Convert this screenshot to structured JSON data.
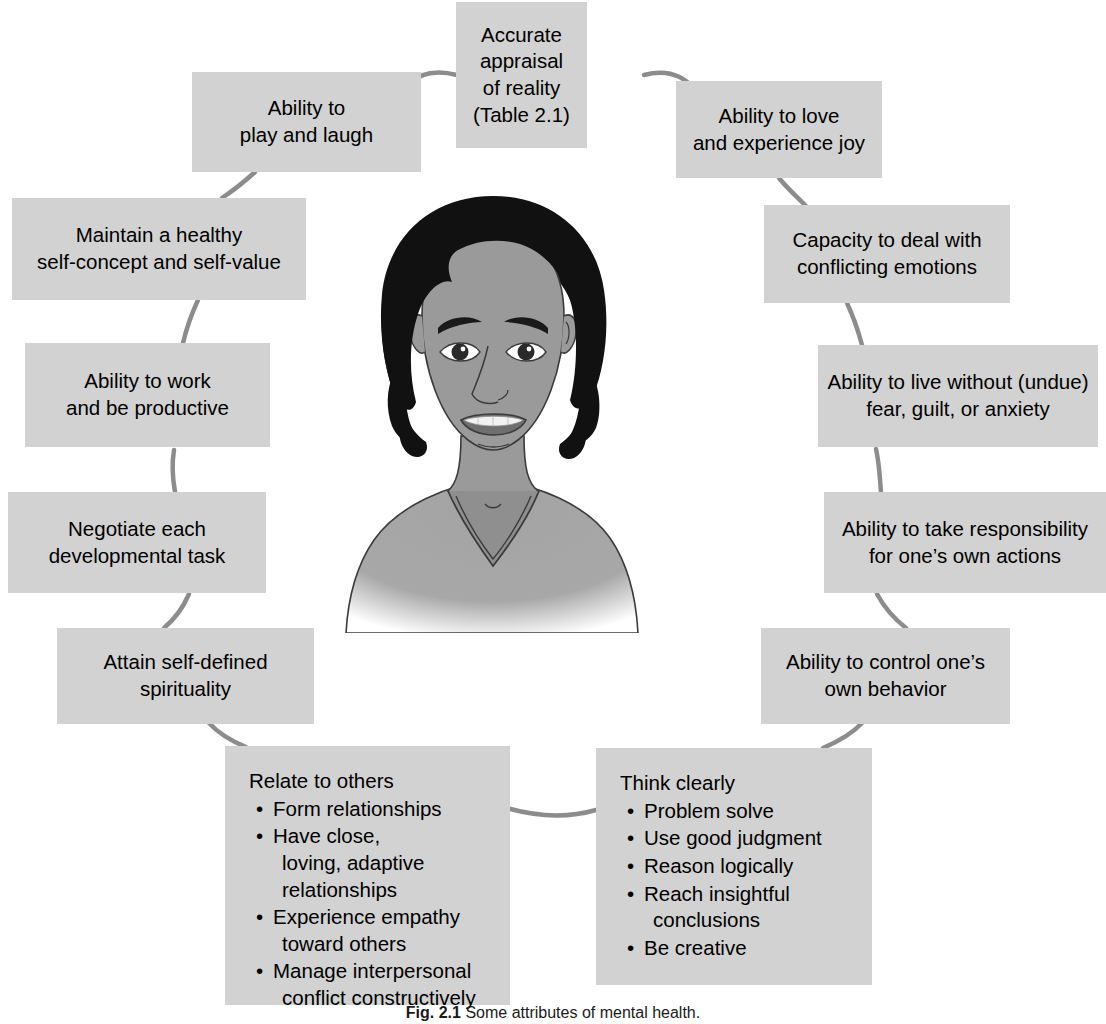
{
  "figure": {
    "caption_label": "Fig. 2.1",
    "caption_text": "Some attributes of mental health.",
    "background_color": "#ffffff",
    "box_color": "#d2d2d2",
    "connector_color": "#8c8c8c",
    "text_color": "#000000"
  },
  "center_image": {
    "alt": "Grayscale illustration of a smiling person with short curly dark hair wearing a v-neck shirt",
    "hair_color": "#111111",
    "skin_color": "#9a9a9a",
    "shirt_color": "#a8a8a8"
  },
  "nodes": [
    {
      "id": "accurate-appraisal",
      "lines": [
        "Accurate",
        "appraisal",
        "of reality",
        "(Table 2.1)"
      ]
    },
    {
      "id": "play-and-laugh",
      "lines": [
        "Ability to",
        "play and laugh"
      ]
    },
    {
      "id": "love-and-joy",
      "lines": [
        "Ability to love",
        "and experience joy"
      ]
    },
    {
      "id": "healthy-self-concept",
      "lines": [
        "Maintain a healthy",
        "self-concept and self-value"
      ]
    },
    {
      "id": "conflicting-emotions",
      "lines": [
        "Capacity to deal with",
        "conflicting emotions"
      ]
    },
    {
      "id": "work-and-productive",
      "lines": [
        "Ability to work",
        "and be productive"
      ]
    },
    {
      "id": "live-without-fear",
      "lines": [
        "Ability to live without (undue)",
        "fear, guilt, or anxiety"
      ]
    },
    {
      "id": "developmental-task",
      "lines": [
        "Negotiate each",
        "developmental task"
      ]
    },
    {
      "id": "take-responsibility",
      "lines": [
        "Ability to take responsibility",
        "for one’s own actions"
      ]
    },
    {
      "id": "self-defined-spirituality",
      "lines": [
        "Attain self-defined",
        "spirituality"
      ]
    },
    {
      "id": "control-own-behavior",
      "lines": [
        "Ability to control one’s",
        "own behavior"
      ]
    }
  ],
  "list_nodes": [
    {
      "id": "relate-to-others",
      "title": "Relate to others",
      "bullets": [
        [
          "Form relationships"
        ],
        [
          "Have close,",
          "loving, adaptive",
          "relationships"
        ],
        [
          "Experience empathy",
          "toward others"
        ],
        [
          "Manage interpersonal",
          "conflict constructively"
        ]
      ]
    },
    {
      "id": "think-clearly",
      "title": "Think clearly",
      "bullets": [
        [
          "Problem solve"
        ],
        [
          "Use good judgment"
        ],
        [
          "Reason logically"
        ],
        [
          "Reach insightful",
          "conclusions"
        ],
        [
          "Be creative"
        ]
      ]
    }
  ]
}
